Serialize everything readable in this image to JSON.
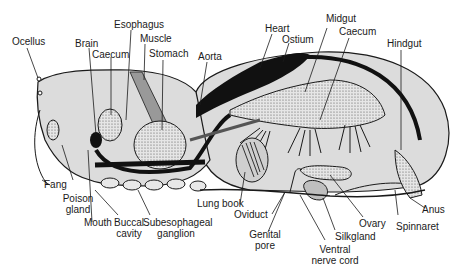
{
  "colors": {
    "body_fill": "#dcdcdc",
    "outline": "#1a1a1a",
    "stipple": "#b5b5b5",
    "dark": "#111111"
  },
  "labels": {
    "ocellus": "Ocellus",
    "brain": "Brain",
    "esophagus": "Esophagus",
    "caecum_front": "Caecum",
    "muscle": "Muscle",
    "stomach": "Stomach",
    "aorta": "Aorta",
    "heart": "Heart",
    "ostium": "Ostium",
    "midgut": "Midgut",
    "caecum_rear": "Caecum",
    "hindgut": "Hindgut",
    "fang": "Fang",
    "poison_gland_1": "Poison",
    "poison_gland_2": "gland",
    "mouth": "Mouth",
    "buccal_1": "Buccal",
    "buccal_2": "cavity",
    "subeso_1": "Subesophageal",
    "subeso_2": "ganglion",
    "lung_book": "Lung book",
    "oviduct": "Oviduct",
    "genital_1": "Genital",
    "genital_2": "pore",
    "ventral_1": "Ventral",
    "ventral_2": "nerve cord",
    "silkgland": "Silkgland",
    "ovary": "Ovary",
    "spinnaret": "Spinnaret",
    "anus": "Anus"
  }
}
